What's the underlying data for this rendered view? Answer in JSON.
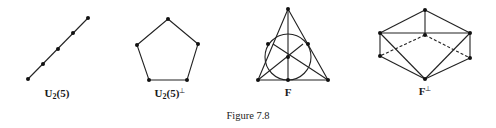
{
  "figure": {
    "caption": "Figure 7.8",
    "stroke_color": "#222222",
    "panels": [
      {
        "id": "u25",
        "label_main": "U",
        "label_sub": "2",
        "label_rest": "(5)",
        "label_sup": "",
        "description": "five collinear points",
        "points": [
          [
            28,
            79
          ],
          [
            43,
            64
          ],
          [
            58,
            49
          ],
          [
            73,
            33
          ],
          [
            88,
            18
          ]
        ],
        "lines": [
          [
            [
              28,
              79
            ],
            [
              88,
              18
            ]
          ]
        ],
        "label_pos": [
          57,
          88
        ]
      },
      {
        "id": "u25-dual",
        "label_main": "U",
        "label_sub": "2",
        "label_rest": "(5)",
        "label_sup": "⊥",
        "description": "pentagon",
        "points": [
          [
            168,
            19
          ],
          [
            198,
            44
          ],
          [
            187,
            80
          ],
          [
            149,
            80
          ],
          [
            137,
            45
          ]
        ],
        "label_pos": [
          170,
          88
        ]
      },
      {
        "id": "fano",
        "label_main": "F",
        "label_sub": "",
        "label_rest": "",
        "label_sup": "",
        "description": "Fano plane",
        "points": [
          [
            288,
            9
          ],
          [
            258,
            80
          ],
          [
            328,
            80
          ],
          [
            288,
            56
          ],
          [
            288,
            80
          ],
          [
            273,
            44
          ],
          [
            303,
            44
          ]
        ],
        "circle": {
          "cx": 288,
          "cy": 57,
          "r": 23
        },
        "label_pos": [
          288,
          87
        ]
      },
      {
        "id": "fano-dual",
        "label_main": "F",
        "label_sub": "",
        "label_rest": "",
        "label_sup": "⊥",
        "description": "dual Fano configuration",
        "points": [
          [
            425,
            10
          ],
          [
            380,
            33
          ],
          [
            470,
            33
          ],
          [
            425,
            35
          ],
          [
            380,
            56
          ],
          [
            470,
            58
          ],
          [
            425,
            79
          ]
        ],
        "label_pos": [
          425,
          86
        ]
      }
    ],
    "caption_pos": [
      248,
      111
    ]
  }
}
